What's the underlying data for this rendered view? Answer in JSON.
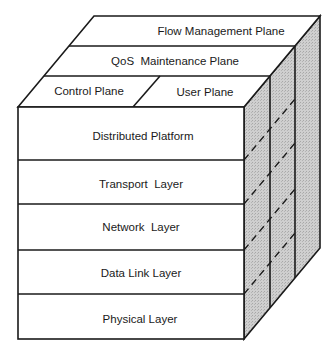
{
  "diagram": {
    "type": "3d-layered-cube",
    "colors": {
      "line": "#1a1a1a",
      "face": "#ffffff",
      "side_shade": "#c8c8c8",
      "background": "#ffffff"
    },
    "top_planes": {
      "flow_management": "Flow Management Plane",
      "qos_maintenance": "QoS  Maintenance Plane",
      "control": "Control Plane",
      "user": "User Plane"
    },
    "front_layers": [
      {
        "label": "Distributed Platform"
      },
      {
        "label": "Transport  Layer"
      },
      {
        "label": "Network  Layer"
      },
      {
        "label": "Data Link Layer"
      },
      {
        "label": "Physical Layer"
      }
    ]
  }
}
